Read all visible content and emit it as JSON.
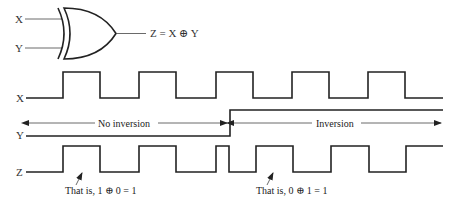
{
  "gate": {
    "type": "XOR",
    "input_labels": [
      "X",
      "Y"
    ],
    "output_expression": "Z = X ⊕ Y"
  },
  "waveforms": {
    "x_label": "X",
    "y_label": "Y",
    "z_label": "Z",
    "x_edges": [
      63,
      100,
      139,
      176,
      216,
      253,
      292,
      329,
      368,
      405
    ],
    "y_edge": 230,
    "z_edges": [
      63,
      100,
      139,
      176,
      216,
      229,
      256,
      293,
      331,
      369,
      406
    ]
  },
  "regions": {
    "left_label": "No inversion",
    "right_label": "Inversion"
  },
  "annotations": [
    {
      "text": "That is, 1 ⊕ 0 = 1"
    },
    {
      "text": "That is, 0 ⊕ 1 = 1"
    }
  ],
  "colors": {
    "line": "#222222",
    "background": "#ffffff"
  }
}
